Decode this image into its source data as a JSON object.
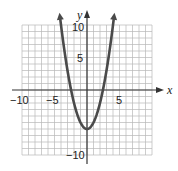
{
  "chart_data": {
    "type": "line",
    "title": "",
    "xlabel": "x",
    "ylabel": "y",
    "xlim": [
      -10,
      10
    ],
    "ylim": [
      -10,
      10
    ],
    "grid": true,
    "x_ticks": [
      {
        "value": -10,
        "label": "−10"
      },
      {
        "value": -5,
        "label": "−5"
      },
      {
        "value": 5,
        "label": "5"
      }
    ],
    "y_ticks": [
      {
        "value": 10,
        "label": "10"
      },
      {
        "value": 5,
        "label": "5"
      },
      {
        "value": -5,
        "label": "−5"
      },
      {
        "value": -10,
        "label": "−10"
      }
    ],
    "series": [
      {
        "name": "parabola",
        "equation": "y = x^2 - 6",
        "color": "#444444",
        "x": [
          -4.3,
          -4,
          -3.5,
          -3,
          -2.5,
          -2,
          -1.5,
          -1,
          -0.5,
          0,
          0.5,
          1,
          1.5,
          2,
          2.5,
          3,
          3.5,
          4,
          4.3
        ],
        "y": [
          12.49,
          10,
          6.25,
          3,
          0.25,
          -2,
          -3.75,
          -5,
          -5.75,
          -6,
          -5.75,
          -5,
          -3.75,
          -2,
          0.25,
          3,
          6.25,
          10,
          12.49
        ]
      }
    ]
  },
  "labels": {
    "x_axis": "x",
    "y_axis": "y",
    "x_neg10": "−10",
    "x_neg5": "−5",
    "x_5": "5",
    "y_10": "10",
    "y_5": "5",
    "y_neg5": "−5",
    "y_neg10": "−10"
  },
  "colors": {
    "grid": "#b8b8b8",
    "axis": "#333333",
    "curve": "#4a4a4a"
  }
}
